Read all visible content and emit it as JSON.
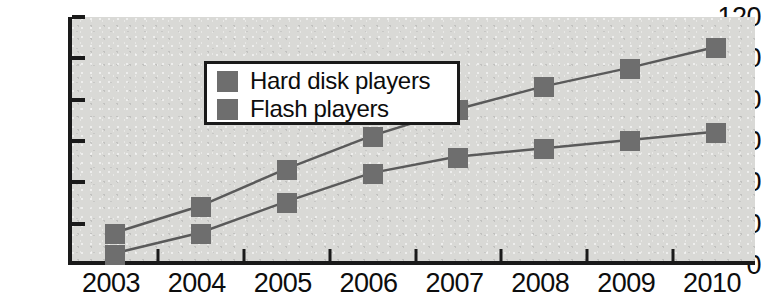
{
  "chart_data": {
    "type": "line",
    "title": "",
    "xlabel": "",
    "ylabel": "",
    "categories": [
      "2003",
      "2004",
      "2005",
      "2006",
      "2007",
      "2008",
      "2009",
      "2010"
    ],
    "series": [
      {
        "name": "Hard disk players",
        "values": [
          5,
          15,
          30,
          44,
          52,
          56,
          60,
          64
        ],
        "color": "#6e6e6e"
      },
      {
        "name": "Flash players",
        "values": [
          15,
          28,
          46,
          62,
          75,
          86,
          95,
          105
        ],
        "color": "#6e6e6e"
      }
    ],
    "ylim": [
      0,
      120
    ],
    "yticks": [
      0,
      20,
      40,
      60,
      80,
      100,
      120
    ],
    "ytick_labels": [
      "0",
      "20",
      "40",
      "60",
      "80",
      "100",
      "120"
    ],
    "grid": false,
    "legend_position": "top-left",
    "marker": "square",
    "line_color": "#5a5a5a",
    "plot_background": "#d9d9d6",
    "axis_color": "#1a1a1a"
  },
  "legend": {
    "entries": [
      {
        "label": "Hard disk players"
      },
      {
        "label": "Flash players"
      }
    ]
  }
}
